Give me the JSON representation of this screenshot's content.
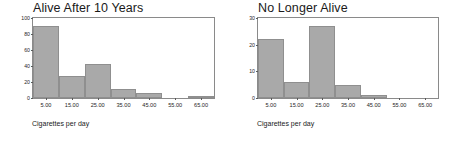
{
  "figure": {
    "background_color": "#ffffff",
    "bar_fill_color": "#a9a9a9",
    "bar_border_color": "#8f8f8f",
    "axis_color": "#8a8a8a",
    "text_color": "#1a1a1a"
  },
  "charts": [
    {
      "id": "alive-after-10-years",
      "title": "Alive After 10 Years",
      "xlabel": "Cigarettes per day",
      "ylabel": "",
      "ytick_labels": [
        "0",
        "20",
        "40",
        "60",
        "80",
        "100"
      ],
      "xtick_labels": [
        "5.00",
        "15.00",
        "25.00",
        "35.00",
        "45.00",
        "55.00",
        "65.00"
      ]
    },
    {
      "id": "no-longer-alive",
      "title": "No Longer Alive",
      "xlabel": "Cigarettes per day",
      "ylabel": "",
      "ytick_labels": [
        "0",
        "10",
        "20",
        "30"
      ],
      "xtick_labels": [
        "5.00",
        "15.00",
        "25.00",
        "35.00",
        "45.00",
        "55.00",
        "65.00"
      ]
    }
  ],
  "chart_data": [
    {
      "type": "bar",
      "title": "Alive After 10 Years",
      "xlabel": "Cigarettes per day",
      "ylabel": "",
      "categories": [
        "5.00",
        "15.00",
        "25.00",
        "35.00",
        "45.00",
        "55.00",
        "65.00"
      ],
      "bin_centers": [
        5,
        15,
        25,
        35,
        45,
        55,
        65
      ],
      "bin_width": 10,
      "values": [
        90,
        27,
        43,
        11,
        6,
        0,
        1
      ],
      "xlim": [
        0,
        70
      ],
      "ylim": [
        0,
        100
      ],
      "ytick_values": [
        0,
        20,
        40,
        60,
        80,
        100
      ],
      "xtick_values": [
        5,
        15,
        25,
        35,
        45,
        55,
        65
      ],
      "grid": false,
      "legend": false
    },
    {
      "type": "bar",
      "title": "No Longer Alive",
      "xlabel": "Cigarettes per day",
      "ylabel": "",
      "categories": [
        "5.00",
        "15.00",
        "25.00",
        "35.00",
        "45.00",
        "55.00",
        "65.00"
      ],
      "bin_centers": [
        5,
        15,
        25,
        35,
        45,
        55,
        65
      ],
      "bin_width": 10,
      "values": [
        22,
        6,
        27,
        5,
        1,
        0,
        0
      ],
      "xlim": [
        0,
        70
      ],
      "ylim": [
        0,
        30
      ],
      "ytick_values": [
        0,
        10,
        20,
        30
      ],
      "xtick_values": [
        5,
        15,
        25,
        35,
        45,
        55,
        65
      ],
      "grid": false,
      "legend": false
    }
  ]
}
